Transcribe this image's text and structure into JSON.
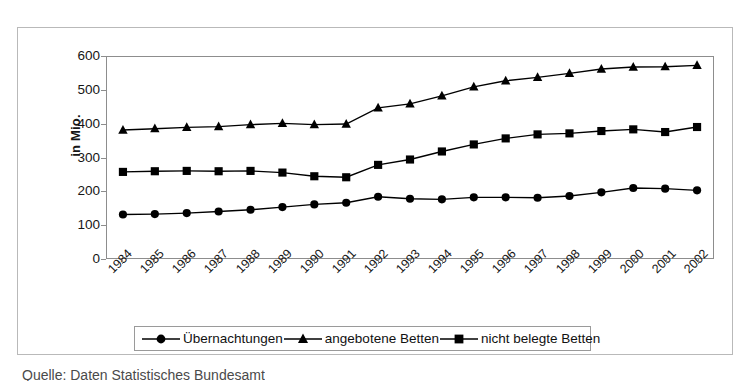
{
  "figure": {
    "y_axis_title": "in Mio.",
    "caption": "Quelle: Daten Statistisches Bundesamt"
  },
  "legend": {
    "position": "bottom",
    "items": [
      {
        "label": "Übernachtungen",
        "marker": "circle-marker-icon",
        "color": "#000000"
      },
      {
        "label": "angebotene Betten",
        "marker": "triangle-marker-icon",
        "color": "#000000"
      },
      {
        "label": "nicht belegte Betten",
        "marker": "square-marker-icon",
        "color": "#000000"
      }
    ]
  },
  "chart_data": {
    "type": "line",
    "title": "",
    "xlabel": "",
    "ylabel": "in Mio.",
    "ylim": [
      0,
      600
    ],
    "ytick_step": 100,
    "yticks": [
      0,
      100,
      200,
      300,
      400,
      500,
      600
    ],
    "ytick_labels": [
      "0",
      "100",
      "200",
      "300",
      "400",
      "500",
      "600"
    ],
    "grid": false,
    "legend_position": "bottom",
    "categories": [
      "1984",
      "1985",
      "1986",
      "1987",
      "1988",
      "1989",
      "1990",
      "1991",
      "1992",
      "1993",
      "1994",
      "1995",
      "1996",
      "1997",
      "1998",
      "1999",
      "2000",
      "2001",
      "2002"
    ],
    "series": [
      {
        "name": "Übernachtungen",
        "marker": "circle",
        "values": [
          130,
          131,
          134,
          139,
          144,
          152,
          160,
          165,
          183,
          177,
          175,
          181,
          181,
          180,
          185,
          196,
          209,
          207,
          202
        ]
      },
      {
        "name": "angebotene Betten",
        "marker": "triangle",
        "values": [
          382,
          386,
          390,
          392,
          398,
          402,
          398,
          400,
          448,
          460,
          484,
          511,
          529,
          539,
          551,
          564,
          570,
          571,
          575
        ]
      },
      {
        "name": "nicht belegte Betten",
        "marker": "square",
        "values": [
          257,
          259,
          260,
          259,
          260,
          255,
          244,
          241,
          278,
          294,
          318,
          339,
          357,
          369,
          372,
          379,
          384,
          376,
          391
        ]
      }
    ]
  }
}
